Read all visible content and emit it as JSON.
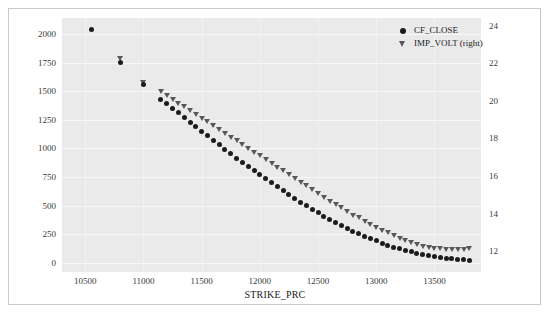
{
  "chart_data": {
    "type": "scatter",
    "title": "",
    "xlabel": "STRIKE_PRC",
    "ylabel": "",
    "y2label": "",
    "xlim": [
      10300,
      13900
    ],
    "ylim": [
      -80,
      2140
    ],
    "y2lim": [
      10.9,
      24.4
    ],
    "grid": true,
    "legend_position": "top-right",
    "xticks": [
      10500,
      11000,
      11500,
      12000,
      12500,
      13000,
      13500
    ],
    "yticks": [
      0,
      250,
      500,
      750,
      1000,
      1250,
      1500,
      1750,
      2000
    ],
    "y2ticks": [
      12,
      14,
      16,
      18,
      20,
      22,
      24
    ],
    "series": [
      {
        "name": "CF_CLOSE",
        "marker": "circle",
        "color": "#1c1c1c",
        "axis": "left",
        "x": [
          10550,
          10800,
          11000,
          11150,
          11200,
          11250,
          11300,
          11350,
          11400,
          11450,
          11500,
          11550,
          11600,
          11650,
          11700,
          11750,
          11800,
          11850,
          11900,
          11950,
          12000,
          12050,
          12100,
          12150,
          12200,
          12250,
          12300,
          12350,
          12400,
          12450,
          12500,
          12550,
          12600,
          12650,
          12700,
          12750,
          12800,
          12850,
          12900,
          12950,
          13000,
          13050,
          13100,
          13150,
          13200,
          13250,
          13300,
          13350,
          13400,
          13450,
          13500,
          13550,
          13600,
          13650,
          13700,
          13750,
          13800
        ],
        "y": [
          2040,
          1752,
          1561,
          1429,
          1390,
          1349,
          1310,
          1268,
          1228,
          1188,
          1149,
          1110,
          1070,
          1031,
          993,
          955,
          916,
          879,
          842,
          805,
          769,
          733,
          698,
          663,
          629,
          595,
          562,
          530,
          499,
          468,
          438,
          409,
          381,
          353,
          327,
          302,
          277,
          254,
          232,
          211,
          191,
          172,
          155,
          138,
          123,
          109,
          96,
          84,
          74,
          64,
          56,
          48,
          42,
          36,
          31,
          27,
          23
        ]
      },
      {
        "name": "IMP_VOLT (right)",
        "marker": "triangle-down",
        "color": "#585858",
        "axis": "right",
        "x": [
          10800,
          11000,
          11150,
          11200,
          11250,
          11300,
          11350,
          11400,
          11450,
          11500,
          11550,
          11600,
          11650,
          11700,
          11750,
          11800,
          11850,
          11900,
          11950,
          12000,
          12050,
          12100,
          12150,
          12200,
          12250,
          12300,
          12350,
          12400,
          12450,
          12500,
          12550,
          12600,
          12650,
          12700,
          12750,
          12800,
          12850,
          12900,
          12950,
          13000,
          13050,
          13100,
          13150,
          13200,
          13250,
          13300,
          13350,
          13400,
          13450,
          13500,
          13550,
          13600,
          13650,
          13700,
          13750,
          13800
        ],
        "y": [
          22.3,
          21.0,
          20.5,
          20.3,
          20.1,
          19.9,
          19.7,
          19.5,
          19.3,
          19.1,
          18.9,
          18.7,
          18.5,
          18.3,
          18.1,
          17.9,
          17.7,
          17.5,
          17.3,
          17.1,
          16.9,
          16.7,
          16.5,
          16.3,
          16.1,
          15.9,
          15.7,
          15.5,
          15.3,
          15.1,
          14.9,
          14.7,
          14.5,
          14.35,
          14.15,
          13.95,
          13.8,
          13.6,
          13.45,
          13.3,
          13.15,
          13.0,
          12.85,
          12.7,
          12.6,
          12.5,
          12.4,
          12.3,
          12.25,
          12.2,
          12.15,
          12.1,
          12.1,
          12.1,
          12.1,
          12.15
        ]
      }
    ],
    "legend": [
      {
        "label": "CF_CLOSE",
        "marker": "circle"
      },
      {
        "label": "IMP_VOLT (right)",
        "marker": "triangle-down"
      }
    ]
  }
}
